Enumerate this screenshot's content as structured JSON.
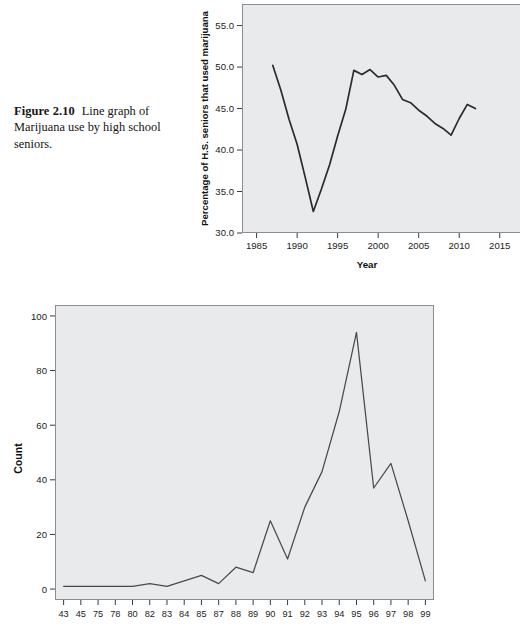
{
  "figure": {
    "label": "Figure 2.10",
    "caption": "Line graph of Marijuana use by high school seniors."
  },
  "chart_data": [
    {
      "id": "marijuana-line-graph",
      "type": "line",
      "title": "",
      "xlabel": "Year",
      "ylabel": "Percentage of H.S. seniors that used marijuana",
      "xlim": [
        1983.2,
        2017.5
      ],
      "ylim": [
        30.0,
        57.6
      ],
      "xticks": [
        1985,
        1990,
        1995,
        2000,
        2005,
        2010,
        2015
      ],
      "xtick_labels": [
        "1985",
        "1990",
        "1995",
        "2000",
        "2005",
        "2010",
        "2015"
      ],
      "yticks": [
        30.0,
        35.0,
        40.0,
        45.0,
        50.0,
        55.0
      ],
      "ytick_labels": [
        "30.0",
        "35.0",
        "40.0",
        "45.0",
        "50.0",
        "55.0"
      ],
      "grid": false,
      "legend": "none",
      "panel_color": "#e9eaec",
      "line_color": "#2b2b2b",
      "x": [
        1987,
        1988,
        1989,
        1990,
        1991,
        1992,
        1993,
        1994,
        1995,
        1996,
        1997,
        1998,
        1999,
        2000,
        2001,
        2002,
        2003,
        2004,
        2005,
        2006,
        2007,
        2008,
        2009,
        2010,
        2011,
        2012
      ],
      "y": [
        50.2,
        47.2,
        43.7,
        40.7,
        36.7,
        32.6,
        35.3,
        38.2,
        41.7,
        44.9,
        49.6,
        49.1,
        49.7,
        48.8,
        49.0,
        47.8,
        46.1,
        45.7,
        44.8,
        44.1,
        43.2,
        42.6,
        41.8,
        43.8,
        45.5,
        45.0
      ],
      "annotations": []
    },
    {
      "id": "count-line-graph",
      "type": "line",
      "title": "",
      "xlabel": "",
      "ylabel": "Count",
      "ylim": [
        -4,
        104
      ],
      "yticks": [
        0,
        20,
        40,
        60,
        80,
        100
      ],
      "ytick_labels": [
        "0",
        "20",
        "40",
        "60",
        "80",
        "100"
      ],
      "grid": false,
      "legend": "none",
      "panel_color": "#e9eaec",
      "line_color": "#4a4a4e",
      "categories": [
        "43",
        "45",
        "75",
        "78",
        "80",
        "82",
        "83",
        "84",
        "85",
        "87",
        "88",
        "89",
        "90",
        "91",
        "92",
        "93",
        "94",
        "95",
        "96",
        "97",
        "98",
        "99"
      ],
      "values": [
        1,
        1,
        1,
        1,
        1,
        2,
        1,
        3,
        5,
        2,
        8,
        6,
        25,
        11,
        30,
        43,
        65,
        94,
        37,
        46,
        25,
        3
      ],
      "annotations": []
    }
  ]
}
